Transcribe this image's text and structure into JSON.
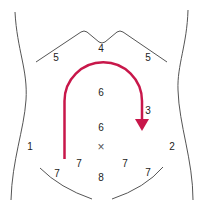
{
  "diagram": {
    "colors": {
      "outline": "#555555",
      "arrow": "#c8174a",
      "text": "#222222"
    },
    "labels": [
      {
        "id": "region-1",
        "text": "1",
        "x": 30,
        "y": 147
      },
      {
        "id": "region-2",
        "text": "2",
        "x": 172,
        "y": 147
      },
      {
        "id": "region-3",
        "text": "3",
        "x": 148,
        "y": 111
      },
      {
        "id": "region-4",
        "text": "4",
        "x": 101,
        "y": 49
      },
      {
        "id": "region-5-left",
        "text": "5",
        "x": 56,
        "y": 58
      },
      {
        "id": "region-5-right",
        "text": "5",
        "x": 148,
        "y": 58
      },
      {
        "id": "region-6-upper",
        "text": "6",
        "x": 101,
        "y": 93
      },
      {
        "id": "region-6-lower",
        "text": "6",
        "x": 101,
        "y": 128
      },
      {
        "id": "umbilicus-marker",
        "text": "×",
        "x": 101,
        "y": 147
      },
      {
        "id": "region-7-a",
        "text": "7",
        "x": 57,
        "y": 174
      },
      {
        "id": "region-7-b",
        "text": "7",
        "x": 79,
        "y": 164
      },
      {
        "id": "region-7-c",
        "text": "7",
        "x": 125,
        "y": 164
      },
      {
        "id": "region-7-d",
        "text": "7",
        "x": 148,
        "y": 173
      },
      {
        "id": "region-8",
        "text": "8",
        "x": 101,
        "y": 178
      }
    ]
  }
}
